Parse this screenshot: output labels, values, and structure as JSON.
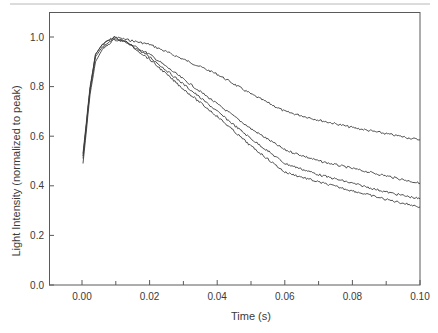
{
  "chart_data": {
    "type": "line",
    "title": "",
    "xlabel": "Time (s)",
    "ylabel": "Light Intensity (normalized to peak)",
    "xlim": [
      -0.0098,
      0.1
    ],
    "ylim": [
      0.0,
      1.1
    ],
    "x_ticks": [
      0.0,
      0.02,
      0.04,
      0.06,
      0.08,
      0.1
    ],
    "x_tick_labels": [
      "0.00",
      "0.02",
      "0.04",
      "0.06",
      "0.08",
      "0.10"
    ],
    "x_minor_ticks": [
      0.01,
      0.03,
      0.05,
      0.07,
      0.09
    ],
    "y_ticks": [
      0.0,
      0.2,
      0.4,
      0.6,
      0.8,
      1.0
    ],
    "y_tick_labels": [
      "0.0",
      "0.2",
      "0.4",
      "0.6",
      "0.8",
      "1.0"
    ],
    "grid": false,
    "legend": null,
    "line_color": "#3c3c3c",
    "x": [
      0.0003,
      0.0024,
      0.004,
      0.006,
      0.0095,
      0.013,
      0.02,
      0.03,
      0.04,
      0.05,
      0.06,
      0.07,
      0.08,
      0.09,
      0.1
    ],
    "series": [
      {
        "name": "trace-1",
        "values": [
          0.53,
          0.8,
          0.93,
          0.97,
          1.0,
          0.99,
          0.97,
          0.91,
          0.85,
          0.77,
          0.7,
          0.665,
          0.635,
          0.61,
          0.585
        ]
      },
      {
        "name": "trace-2",
        "values": [
          0.52,
          0.79,
          0.93,
          0.97,
          1.0,
          0.98,
          0.93,
          0.83,
          0.73,
          0.63,
          0.545,
          0.5,
          0.47,
          0.44,
          0.41
        ]
      },
      {
        "name": "trace-3",
        "values": [
          0.51,
          0.79,
          0.92,
          0.96,
          0.99,
          0.98,
          0.92,
          0.81,
          0.7,
          0.59,
          0.49,
          0.445,
          0.41,
          0.375,
          0.347
        ]
      },
      {
        "name": "trace-4",
        "values": [
          0.49,
          0.77,
          0.9,
          0.95,
          0.99,
          0.98,
          0.91,
          0.79,
          0.68,
          0.56,
          0.455,
          0.415,
          0.38,
          0.345,
          0.315
        ]
      }
    ]
  }
}
